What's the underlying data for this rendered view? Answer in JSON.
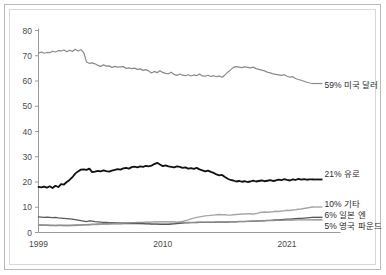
{
  "chart_data": {
    "type": "line",
    "title": "",
    "subtitle": "",
    "xlabel": "",
    "ylabel": "",
    "xlim": [
      1999,
      2021.75
    ],
    "ylim": [
      0,
      80
    ],
    "yticks": [
      "0",
      "10",
      "20",
      "30",
      "40",
      "50",
      "60",
      "70",
      "80"
    ],
    "xticks": [
      "1999",
      "2010",
      "2021"
    ],
    "xtick_values": [
      1999,
      2010,
      2021
    ],
    "grid": false,
    "legend_position": "right-inline-end-labels",
    "x_start": 1999.0,
    "x_step": 0.25,
    "series": [
      {
        "name": "59% 미국 달러",
        "end_label": "59% 미국 달러",
        "color": "#8a8a8a",
        "width": 1.2,
        "values": [
          71.0,
          71.5,
          71.0,
          71.3,
          71.2,
          71.8,
          71.5,
          72.0,
          71.9,
          72.3,
          71.6,
          72.2,
          71.7,
          72.6,
          71.9,
          72.4,
          71.3,
          67.5,
          67.0,
          67.2,
          66.8,
          66.2,
          65.8,
          66.4,
          65.9,
          66.0,
          65.4,
          65.8,
          65.5,
          65.6,
          65.7,
          65.0,
          65.2,
          64.9,
          65.1,
          64.6,
          64.8,
          64.2,
          64.5,
          64.0,
          63.2,
          63.8,
          63.3,
          64.1,
          63.4,
          63.0,
          62.9,
          63.5,
          62.6,
          62.2,
          62.8,
          62.3,
          62.1,
          62.5,
          62.0,
          62.4,
          62.1,
          62.8,
          62.0,
          61.9,
          62.3,
          61.8,
          62.1,
          61.7,
          62.0,
          61.5,
          62.4,
          63.5,
          64.4,
          65.4,
          65.7,
          65.5,
          65.3,
          65.6,
          65.4,
          65.2,
          65.5,
          64.9,
          64.6,
          64.3,
          64.0,
          63.5,
          63.2,
          62.8,
          62.6,
          62.4,
          62.2,
          62.5,
          61.9,
          61.5,
          61.7,
          61.0,
          60.6,
          60.3,
          59.9,
          59.5,
          59.2,
          59.0
        ]
      },
      {
        "name": "21% 유로",
        "end_label": "21% 유로",
        "color": "#111111",
        "width": 1.8,
        "values": [
          18.1,
          17.9,
          18.2,
          17.8,
          18.3,
          17.6,
          18.5,
          18.0,
          19.2,
          19.0,
          20.0,
          20.8,
          21.9,
          23.3,
          24.2,
          24.9,
          25.0,
          24.8,
          25.3,
          23.9,
          24.1,
          24.4,
          24.2,
          24.6,
          24.3,
          24.1,
          24.5,
          24.8,
          25.1,
          24.9,
          25.4,
          25.6,
          25.3,
          25.9,
          26.1,
          25.8,
          26.2,
          26.0,
          26.4,
          26.2,
          26.5,
          27.1,
          27.6,
          26.9,
          26.3,
          26.6,
          26.2,
          26.0,
          25.8,
          26.2,
          26.0,
          25.6,
          25.8,
          25.3,
          25.5,
          25.2,
          25.6,
          25.0,
          24.6,
          24.2,
          24.5,
          24.0,
          23.6,
          23.0,
          22.6,
          22.8,
          22.0,
          21.3,
          20.8,
          20.6,
          20.2,
          20.4,
          20.1,
          20.3,
          20.0,
          20.2,
          20.5,
          20.2,
          20.4,
          20.6,
          20.3,
          20.5,
          20.7,
          20.4,
          20.6,
          20.9,
          20.7,
          21.1,
          20.8,
          20.6,
          21.0,
          20.8,
          21.2,
          20.9,
          21.1,
          20.9,
          21.0,
          21.0
        ]
      },
      {
        "name": "10% 기타",
        "end_label": "10% 기타",
        "color": "#a6a6a6",
        "width": 1.4,
        "values": [
          3.1,
          3.1,
          3.0,
          3.0,
          2.9,
          2.9,
          2.8,
          2.8,
          2.8,
          2.7,
          2.7,
          2.7,
          2.8,
          2.8,
          2.9,
          2.9,
          3.0,
          3.0,
          3.0,
          3.1,
          3.1,
          3.1,
          3.2,
          3.2,
          3.2,
          3.2,
          3.3,
          3.3,
          3.3,
          3.3,
          3.4,
          3.4,
          3.4,
          3.4,
          3.4,
          3.4,
          3.5,
          3.5,
          3.5,
          3.5,
          3.4,
          3.4,
          3.4,
          3.4,
          3.4,
          3.4,
          3.4,
          3.5,
          3.6,
          3.8,
          4.1,
          4.4,
          4.7,
          5.0,
          5.4,
          5.7,
          6.0,
          6.2,
          6.4,
          6.6,
          6.7,
          6.8,
          6.9,
          7.0,
          7.1,
          7.0,
          7.0,
          6.9,
          6.9,
          7.0,
          7.1,
          7.2,
          7.3,
          7.3,
          7.4,
          7.4,
          7.3,
          7.5,
          7.8,
          8.0,
          8.1,
          8.0,
          8.1,
          8.2,
          8.4,
          8.3,
          8.5,
          8.6,
          8.8,
          8.7,
          8.9,
          9.0,
          9.2,
          9.3,
          9.5,
          9.7,
          9.9,
          10.1
        ]
      },
      {
        "name": "6% 일본 엔",
        "end_label": "6% 일본 엔",
        "color": "#595959",
        "width": 1.4,
        "values": [
          6.2,
          6.1,
          6.0,
          6.1,
          6.0,
          5.9,
          6.0,
          5.8,
          5.7,
          5.6,
          5.5,
          5.4,
          5.3,
          5.1,
          4.9,
          4.7,
          4.5,
          4.3,
          4.6,
          4.5,
          4.3,
          4.2,
          4.1,
          4.0,
          4.0,
          3.9,
          3.9,
          3.9,
          3.8,
          3.8,
          3.7,
          3.7,
          3.7,
          3.6,
          3.6,
          3.6,
          3.5,
          3.5,
          3.4,
          3.4,
          3.3,
          3.3,
          3.3,
          3.2,
          3.2,
          3.2,
          3.2,
          3.3,
          3.4,
          3.5,
          3.6,
          3.7,
          3.8,
          3.8,
          3.9,
          3.9,
          3.9,
          4.0,
          4.0,
          4.0,
          4.0,
          4.0,
          4.0,
          4.1,
          4.1,
          4.1,
          4.1,
          4.1,
          4.2,
          4.2,
          4.2,
          4.3,
          4.3,
          4.3,
          4.4,
          4.4,
          4.5,
          4.5,
          4.6,
          4.6,
          4.7,
          4.8,
          4.8,
          4.9,
          5.0,
          5.0,
          5.1,
          5.2,
          5.3,
          5.3,
          5.4,
          5.5,
          5.6,
          5.6,
          5.7,
          5.8,
          5.9,
          6.0
        ]
      },
      {
        "name": "5% 영국 파운드",
        "end_label": "5% 영국 파운드",
        "color": "#8f8f8f",
        "width": 1.4,
        "values": [
          2.9,
          2.9,
          2.9,
          2.9,
          2.8,
          2.8,
          2.8,
          2.9,
          2.9,
          2.9,
          2.9,
          2.9,
          2.9,
          3.0,
          3.0,
          3.0,
          3.1,
          3.1,
          3.2,
          3.3,
          3.3,
          3.4,
          3.4,
          3.5,
          3.5,
          3.6,
          3.6,
          3.7,
          3.7,
          3.8,
          3.8,
          3.8,
          3.9,
          3.9,
          3.9,
          4.0,
          4.0,
          4.0,
          4.1,
          4.1,
          4.1,
          4.2,
          4.2,
          4.2,
          4.2,
          4.2,
          4.2,
          4.2,
          4.2,
          4.1,
          4.1,
          4.1,
          4.0,
          4.0,
          4.0,
          4.0,
          4.1,
          4.1,
          4.1,
          4.1,
          4.1,
          4.1,
          4.1,
          4.2,
          4.2,
          4.2,
          4.2,
          4.2,
          4.3,
          4.3,
          4.3,
          4.4,
          4.4,
          4.4,
          4.4,
          4.5,
          4.5,
          4.5,
          4.6,
          4.6,
          4.6,
          4.7,
          4.7,
          4.7,
          4.8,
          4.8,
          4.8,
          4.9,
          4.9,
          4.9,
          4.9,
          5.0,
          5.0,
          5.0,
          5.0,
          5.0,
          5.0,
          5.0
        ]
      }
    ]
  },
  "axis": {
    "axis_color": "#9a9a9a",
    "tick_color": "#9a9a9a",
    "label_color": "#4a4a4a"
  }
}
